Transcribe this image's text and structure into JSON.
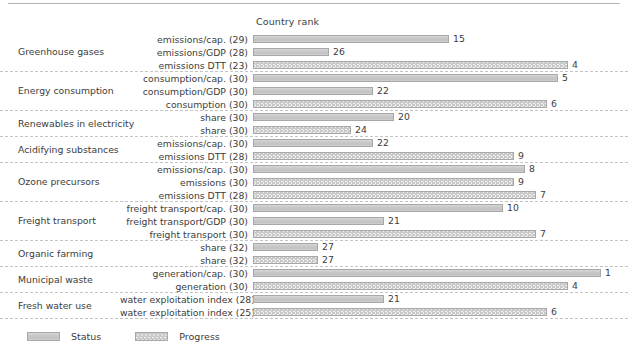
{
  "header": {
    "column_title": "Country rank"
  },
  "legend": {
    "status_label": "Status",
    "progress_label": "Progress",
    "status_color": "#c9c9c9",
    "progress_color": "#f2f2f2",
    "border_color": "#a8a8a8"
  },
  "chart_data": {
    "type": "bar",
    "title": "Country rank",
    "xlabel": "",
    "ylabel": "",
    "orientation": "horizontal",
    "value_axis_note": "Bar length is inversely proportional to country rank (rank 1 = longest bar); max scale 32 countries",
    "max_rank": 32,
    "series": [
      {
        "name": "Status",
        "style": "solid-fill"
      },
      {
        "name": "Progress",
        "style": "hatched-chevron"
      }
    ],
    "groups": [
      {
        "category": "Greenhouse gases",
        "rows": [
          {
            "label": "emissions/cap. (29)",
            "total": 29,
            "rank": 15,
            "series": "Status"
          },
          {
            "label": "emissions/GDP (28)",
            "total": 28,
            "rank": 26,
            "series": "Status"
          },
          {
            "label": "emissions DTT (23)",
            "total": 23,
            "rank": 4,
            "series": "Progress"
          }
        ]
      },
      {
        "category": "Energy consumption",
        "rows": [
          {
            "label": "consumption/cap. (30)",
            "total": 30,
            "rank": 5,
            "series": "Status"
          },
          {
            "label": "consumption/GDP (30)",
            "total": 30,
            "rank": 22,
            "series": "Status"
          },
          {
            "label": "consumption (30)",
            "total": 30,
            "rank": 6,
            "series": "Progress"
          }
        ]
      },
      {
        "category": "Renewables in electricity",
        "rows": [
          {
            "label": "share (30)",
            "total": 30,
            "rank": 20,
            "series": "Status"
          },
          {
            "label": "share (30)",
            "total": 30,
            "rank": 24,
            "series": "Progress"
          }
        ]
      },
      {
        "category": "Acidifying substances",
        "rows": [
          {
            "label": "emissions/cap. (30)",
            "total": 30,
            "rank": 22,
            "series": "Status"
          },
          {
            "label": "emissions DTT (28)",
            "total": 28,
            "rank": 9,
            "series": "Progress"
          }
        ]
      },
      {
        "category": "Ozone precursors",
        "rows": [
          {
            "label": "emissions/cap. (30)",
            "total": 30,
            "rank": 8,
            "series": "Status"
          },
          {
            "label": "emissions (30)",
            "total": 30,
            "rank": 9,
            "series": "Progress"
          },
          {
            "label": "emissions DTT (28)",
            "total": 28,
            "rank": 7,
            "series": "Progress"
          }
        ]
      },
      {
        "category": "Freight transport",
        "rows": [
          {
            "label": "freight transport/cap. (30)",
            "total": 30,
            "rank": 10,
            "series": "Status"
          },
          {
            "label": "freight transport/GDP (30)",
            "total": 30,
            "rank": 21,
            "series": "Status"
          },
          {
            "label": "freight transport (30)",
            "total": 30,
            "rank": 7,
            "series": "Progress"
          }
        ]
      },
      {
        "category": "Organic farming",
        "rows": [
          {
            "label": "share (32)",
            "total": 32,
            "rank": 27,
            "series": "Status"
          },
          {
            "label": "share (32)",
            "total": 32,
            "rank": 27,
            "series": "Progress"
          }
        ]
      },
      {
        "category": "Municipal waste",
        "rows": [
          {
            "label": "generation/cap. (30)",
            "total": 30,
            "rank": 1,
            "series": "Status"
          },
          {
            "label": "generation (30)",
            "total": 30,
            "rank": 4,
            "series": "Progress"
          }
        ]
      },
      {
        "category": "Fresh water use",
        "rows": [
          {
            "label": "water exploitation index (28)",
            "total": 28,
            "rank": 21,
            "series": "Status"
          },
          {
            "label": "water exploitation index (25)",
            "total": 25,
            "rank": 6,
            "series": "Progress"
          }
        ]
      }
    ]
  }
}
